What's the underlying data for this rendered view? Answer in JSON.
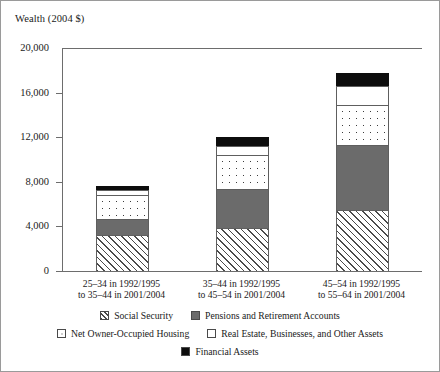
{
  "figure": {
    "axis_title": "Wealth (2004 $)"
  },
  "chart_data": {
    "type": "bar",
    "title": "",
    "subtitle": "",
    "xlabel": "",
    "ylabel": "Wealth (2004 $)",
    "stacked": true,
    "grid": false,
    "legend_position": "bottom",
    "ylim": [
      0,
      20000
    ],
    "yticks": [
      0,
      4000,
      8000,
      12000,
      16000,
      20000
    ],
    "ytick_labels": [
      "0",
      "4,000",
      "8,000",
      "12,000",
      "16,000",
      "20,000"
    ],
    "categories": [
      "25–34 in 1992/1995\nto 35–44 in 2001/2004",
      "35–44 in 1992/1995\nto 45–54 in 2001/2004",
      "45–54 in 1992/1995\nto 55–64 in 2001/2004"
    ],
    "category_lines": [
      [
        "25–34 in 1992/1995",
        "to 35–44 in 2001/2004"
      ],
      [
        "35–44 in 1992/1995",
        "to 45–54 in 2001/2004"
      ],
      [
        "45–54 in 1992/1995",
        "to 55–64 in 2001/2004"
      ]
    ],
    "series": [
      {
        "name": "Social Security",
        "pattern": "diagonal-hatch",
        "values": [
          3250,
          3900,
          5500
        ]
      },
      {
        "name": "Pensions and Retirement Accounts",
        "pattern": "solid-gray",
        "values": [
          1450,
          3500,
          5800
        ]
      },
      {
        "name": "Net Owner-Occupied Housing",
        "pattern": "dotted",
        "values": [
          2100,
          3000,
          3600
        ]
      },
      {
        "name": "Real Estate, Businesses, and Other Assets",
        "pattern": "white",
        "values": [
          450,
          800,
          1700
        ]
      },
      {
        "name": "Financial Assets",
        "pattern": "solid-black",
        "values": [
          400,
          800,
          1150
        ]
      }
    ],
    "totals": [
      7650,
      12000,
      17750
    ]
  },
  "legend": {
    "row1": [
      {
        "label": "Social Security"
      },
      {
        "label": "Pensions and Retirement Accounts"
      }
    ],
    "row2": [
      {
        "label": "Net Owner-Occupied Housing"
      },
      {
        "label": "Real Estate, Businesses, and Other Assets"
      }
    ],
    "row3": [
      {
        "label": "Financial Assets"
      }
    ]
  }
}
